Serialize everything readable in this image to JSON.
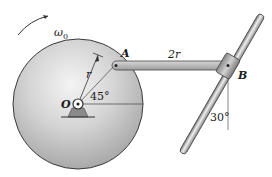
{
  "diagram": {
    "type": "mechanism",
    "labels": {
      "angular_velocity": "ω",
      "angular_velocity_sub": "0",
      "point_a": "A",
      "point_b": "B",
      "point_o": "O",
      "radius": "r",
      "link_length": "2r",
      "angle_disk": "45°",
      "angle_rod": "30°"
    },
    "colors": {
      "disk_fill_light": "#f2f2f2",
      "disk_fill_dark": "#a8a8a8",
      "outline": "#3a3a3a",
      "link_fill": "#b8b8b8",
      "rod_fill": "#c8c8c8",
      "collar_fill": "#9a9a9a",
      "support_fill": "#8a8a8a"
    }
  }
}
